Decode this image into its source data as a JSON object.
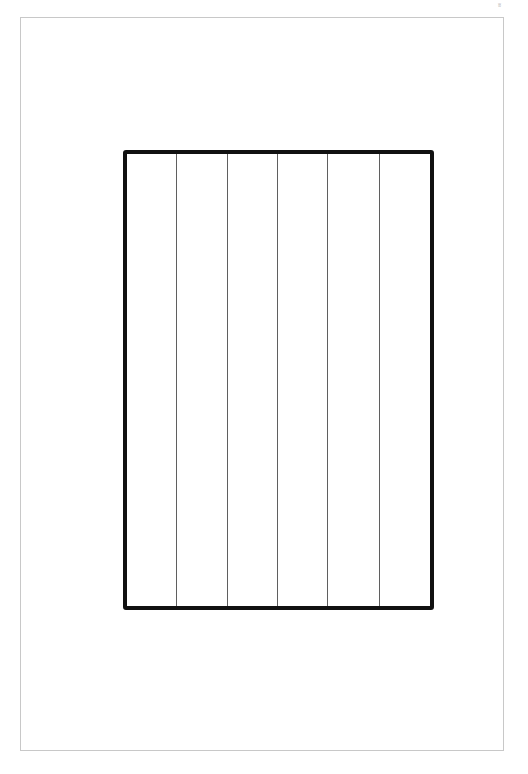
{
  "page": {
    "background": "#ffffff",
    "frame_color": "#c8c8c8",
    "corner_mark": "ʬ"
  },
  "grid": {
    "border_color": "#111111",
    "column_count": 6,
    "column_divider_positions_px": [
      53,
      104,
      154,
      204,
      256
    ]
  }
}
